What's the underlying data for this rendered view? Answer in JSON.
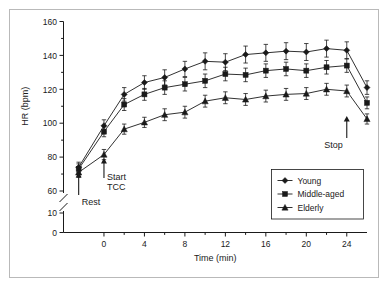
{
  "figure": {
    "background": "#ffffff",
    "frame_color": "#b9b9b9",
    "ink_color": "#1a1a1a"
  },
  "chart_data": {
    "type": "line",
    "title": "",
    "xlabel": "Time (min)",
    "ylabel": "HR (bpm)",
    "xlim": [
      -4,
      26
    ],
    "ylim": [
      0,
      160
    ],
    "y_axis_break": {
      "present": true,
      "below": 60,
      "resume": 10
    },
    "grid": false,
    "legend_position": "bottom-right",
    "xticks": [
      0,
      4,
      8,
      12,
      16,
      20,
      24
    ],
    "xticks_minor": [
      2,
      6,
      10,
      14,
      18,
      22
    ],
    "yticks": [
      0,
      10,
      60,
      80,
      100,
      120,
      140,
      160
    ],
    "yticks_minor": [
      70,
      90,
      110,
      130,
      150
    ],
    "x": [
      -2.5,
      0,
      2,
      4,
      6,
      8,
      10,
      12,
      14,
      16,
      18,
      20,
      22,
      24,
      26
    ],
    "series": [
      {
        "name": "Young",
        "marker": "diamond",
        "values": [
          74,
          98.5,
          117,
          124,
          127,
          132,
          136.5,
          136,
          140.5,
          141.5,
          142.5,
          142,
          144,
          143,
          121
        ],
        "errors": [
          3,
          3.5,
          4,
          4,
          4.5,
          4.5,
          5,
          5,
          5,
          5,
          5,
          5,
          5,
          5,
          4
        ]
      },
      {
        "name": "Middle-aged",
        "marker": "square",
        "values": [
          73,
          95,
          111,
          117,
          121,
          123,
          125,
          129,
          128.5,
          131,
          132,
          131,
          133,
          134,
          112
        ],
        "errors": [
          3,
          3,
          3.5,
          3.5,
          4,
          4,
          4,
          4,
          4,
          4,
          4,
          4,
          4,
          4,
          3.5
        ]
      },
      {
        "name": "Elderly",
        "marker": "triangle",
        "values": [
          71,
          81.5,
          96.5,
          100.5,
          105,
          106.5,
          113,
          115,
          114,
          116,
          117,
          117.5,
          120,
          119,
          102.5
        ],
        "errors": [
          3,
          3,
          3,
          3,
          3.5,
          3.5,
          3.5,
          3.5,
          3.5,
          3.5,
          3.5,
          3.5,
          3.5,
          3.5,
          3
        ]
      }
    ],
    "annotations": [
      {
        "label": "Rest",
        "at_x": -2.5,
        "arrow": "up"
      },
      {
        "label": "Start\nTCC",
        "label_line1": "Start",
        "label_line2": "TCC",
        "at_x": 0,
        "arrow": "up"
      },
      {
        "label": "Stop",
        "at_x": 24,
        "arrow": "up"
      }
    ]
  },
  "legend": {
    "items": [
      {
        "label": "Young",
        "marker": "diamond"
      },
      {
        "label": "Middle-aged",
        "marker": "square"
      },
      {
        "label": "Elderly",
        "marker": "triangle"
      }
    ]
  }
}
